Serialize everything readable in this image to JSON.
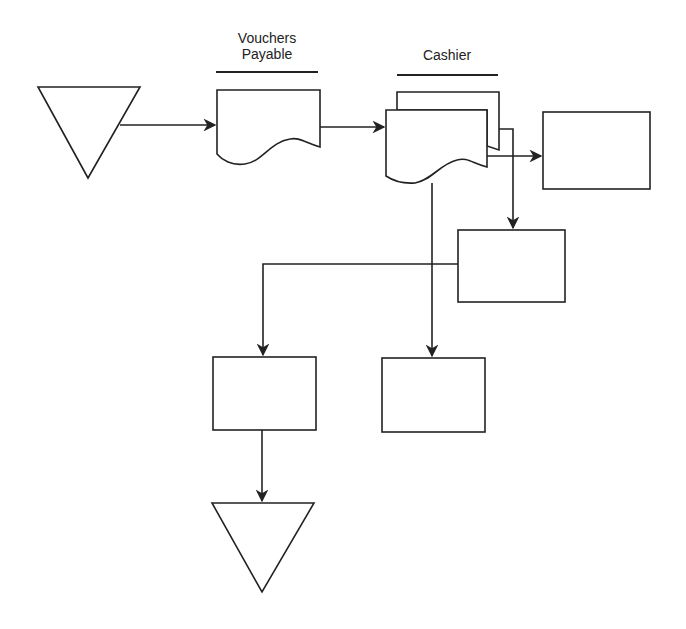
{
  "diagram": {
    "type": "document flowchart",
    "columns": [
      {
        "id": "vouchers-payable",
        "label_line1": "Vouchers",
        "label_line2": "Payable"
      },
      {
        "id": "cashier",
        "label": "Cashier"
      }
    ],
    "nodes": [
      {
        "id": "file-start",
        "shape": "inverted-triangle (file)",
        "text": ""
      },
      {
        "id": "vp-document",
        "shape": "document",
        "text": ""
      },
      {
        "id": "cashier-document-multi",
        "shape": "multi-copy document",
        "text": ""
      },
      {
        "id": "box-right",
        "shape": "rectangle",
        "text": ""
      },
      {
        "id": "box-middle-right",
        "shape": "rectangle",
        "text": ""
      },
      {
        "id": "box-bottom-left",
        "shape": "rectangle",
        "text": ""
      },
      {
        "id": "box-bottom-center",
        "shape": "rectangle",
        "text": ""
      },
      {
        "id": "file-end",
        "shape": "inverted-triangle (file)",
        "text": ""
      }
    ],
    "edges": [
      {
        "from": "file-start",
        "to": "vp-document"
      },
      {
        "from": "vp-document",
        "to": "cashier-document-multi"
      },
      {
        "from": "cashier-document-multi",
        "to": "box-right"
      },
      {
        "from": "cashier-document-multi",
        "to": "box-middle-right"
      },
      {
        "from": "cashier-document-multi",
        "to": "box-bottom-center"
      },
      {
        "from": "box-middle-right",
        "to": "box-bottom-left"
      },
      {
        "from": "box-bottom-left",
        "to": "file-end"
      }
    ],
    "colors": {
      "stroke": "#222222",
      "background": "#ffffff"
    }
  }
}
